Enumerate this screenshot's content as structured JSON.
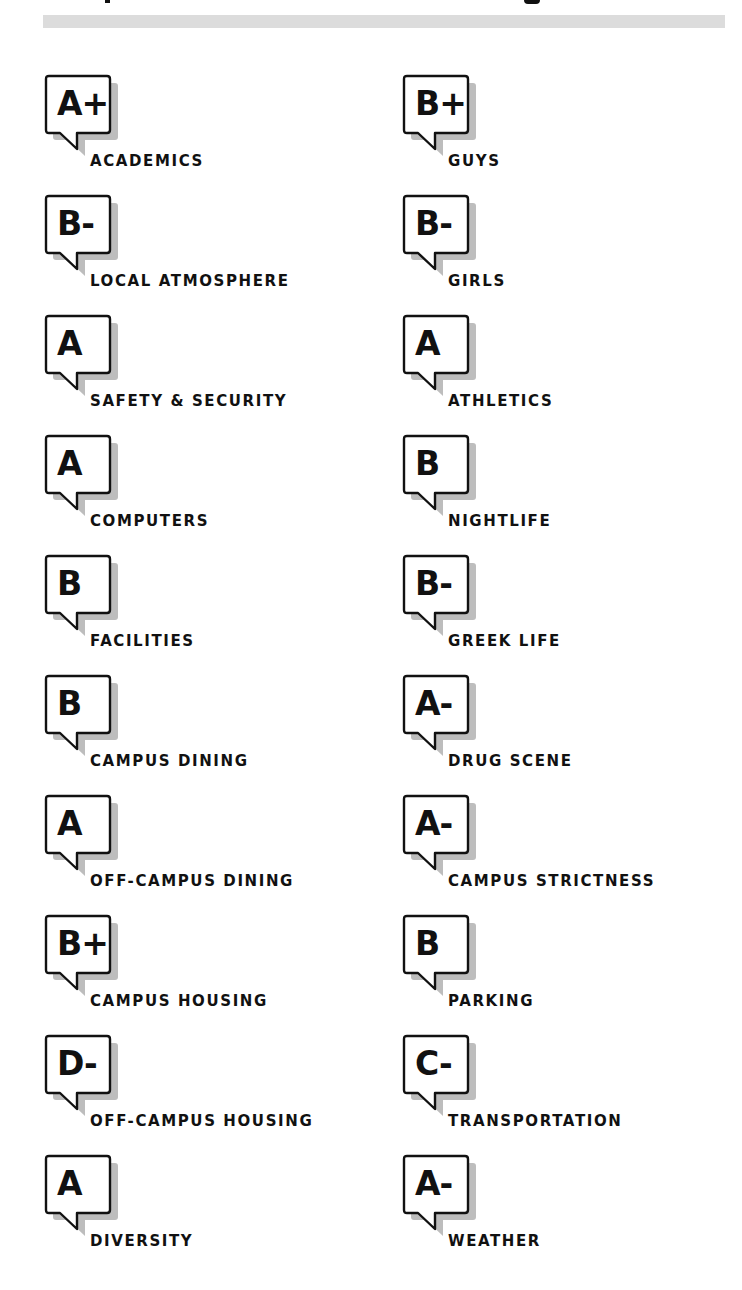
{
  "colors": {
    "ink": "#111111",
    "rule": "#dcdcdc",
    "shadow": "#bdbdbd",
    "background": "#ffffff"
  },
  "grades": {
    "left": [
      {
        "grade": "A+",
        "category": "ACADEMICS"
      },
      {
        "grade": "B-",
        "category": "LOCAL ATMOSPHERE"
      },
      {
        "grade": "A",
        "category": "SAFETY & SECURITY"
      },
      {
        "grade": "A",
        "category": "COMPUTERS"
      },
      {
        "grade": "B",
        "category": "FACILITIES"
      },
      {
        "grade": "B",
        "category": "CAMPUS DINING"
      },
      {
        "grade": "A",
        "category": "OFF-CAMPUS DINING"
      },
      {
        "grade": "B+",
        "category": "CAMPUS HOUSING"
      },
      {
        "grade": "D-",
        "category": "OFF-CAMPUS HOUSING"
      },
      {
        "grade": "A",
        "category": "DIVERSITY"
      }
    ],
    "right": [
      {
        "grade": "B+",
        "category": "GUYS"
      },
      {
        "grade": "B-",
        "category": "GIRLS"
      },
      {
        "grade": "A",
        "category": "ATHLETICS"
      },
      {
        "grade": "B",
        "category": "NIGHTLIFE"
      },
      {
        "grade": "B-",
        "category": "GREEK LIFE"
      },
      {
        "grade": "A-",
        "category": "DRUG SCENE"
      },
      {
        "grade": "A-",
        "category": "CAMPUS STRICTNESS"
      },
      {
        "grade": "B",
        "category": "PARKING"
      },
      {
        "grade": "C-",
        "category": "TRANSPORTATION"
      },
      {
        "grade": "A-",
        "category": "WEATHER"
      }
    ]
  }
}
